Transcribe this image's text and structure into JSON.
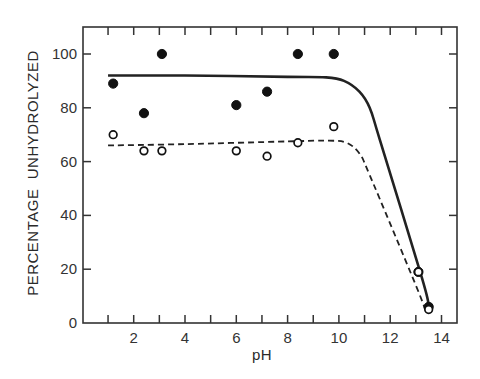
{
  "chart_data": {
    "type": "scatter",
    "title": "",
    "xlabel": "pH",
    "ylabel": "PERCENTAGE  UNHYDROLYZED",
    "xlim": [
      0,
      14.5
    ],
    "ylim": [
      0,
      110
    ],
    "x_ticks": [
      1,
      2,
      3,
      4,
      5,
      6,
      7,
      8,
      9,
      10,
      11,
      12,
      13,
      14
    ],
    "x_tick_labels": [
      "2",
      "4",
      "6",
      "8",
      "10",
      "12",
      "14"
    ],
    "x_tick_label_values": [
      2,
      4,
      6,
      8,
      10,
      12,
      14
    ],
    "y_ticks": [
      0,
      20,
      40,
      60,
      80,
      100
    ],
    "y_tick_labels": [
      "0",
      "20",
      "40",
      "60",
      "80",
      "100"
    ],
    "grid": false,
    "legend": null,
    "series": [
      {
        "name": "filled circles",
        "marker": "filled-circle",
        "x": [
          1.2,
          2.4,
          3.1,
          6.0,
          7.2,
          8.4,
          9.8,
          13.1,
          13.5
        ],
        "y": [
          89,
          78,
          100,
          81,
          86,
          100,
          100,
          19,
          6
        ]
      },
      {
        "name": "open circles",
        "marker": "open-circle",
        "x": [
          1.2,
          2.4,
          3.1,
          6.0,
          7.2,
          8.4,
          9.8,
          13.1,
          13.5
        ],
        "y": [
          70,
          64,
          64,
          64,
          62,
          67,
          73,
          19,
          5
        ]
      },
      {
        "name": "solid fit curve",
        "line": "solid",
        "x": [
          1.0,
          4.0,
          8.0,
          9.5,
          10.2,
          10.8,
          11.2,
          11.6,
          13.2,
          13.5
        ],
        "y": [
          92,
          92,
          91.5,
          91.3,
          90,
          86,
          80,
          68,
          18,
          7
        ]
      },
      {
        "name": "dashed fit curve",
        "line": "dashed",
        "x": [
          1.0,
          4.0,
          8.0,
          9.6,
          10.3,
          10.8,
          11.2,
          13.0,
          13.4
        ],
        "y": [
          66,
          66.5,
          67.5,
          67.8,
          67,
          63,
          55,
          14,
          4
        ]
      }
    ]
  },
  "axes": {
    "xlabel": "pH",
    "ylabel": "PERCENTAGE  UNHYDROLYZED"
  }
}
